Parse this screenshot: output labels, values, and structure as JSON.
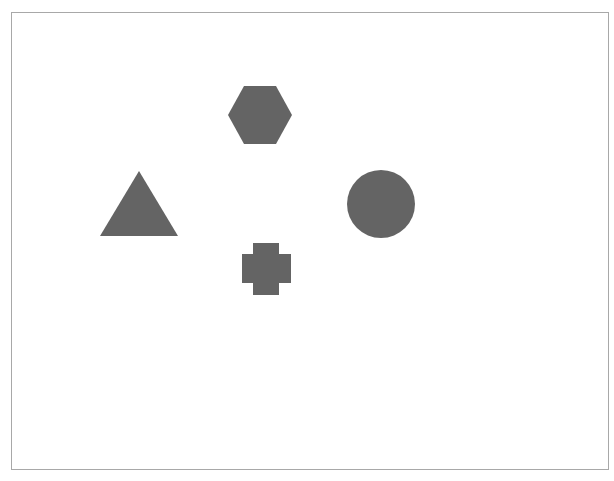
{
  "canvas": {
    "width": 614,
    "height": 481,
    "background": "#ffffff",
    "frame_border_color": "#a8a8a8"
  },
  "shapes": [
    {
      "type": "hexagon",
      "name": "hexagon-shape",
      "color": "#646464",
      "cx": 260,
      "cy": 115,
      "w": 64,
      "h": 58
    },
    {
      "type": "triangle",
      "name": "triangle-shape",
      "color": "#646464",
      "apex_x": 139,
      "apex_y": 171,
      "base_left_x": 100,
      "base_right_x": 178,
      "base_y": 236
    },
    {
      "type": "circle",
      "name": "circle-shape",
      "color": "#646464",
      "cx": 381,
      "cy": 204,
      "r": 34
    },
    {
      "type": "cross",
      "name": "cross-shape",
      "color": "#646464",
      "x1": 242,
      "x2": 291,
      "y1": 243,
      "y2": 295,
      "arm_x1": 253,
      "arm_x2": 279,
      "arm_y1": 254,
      "arm_y2": 283
    }
  ]
}
